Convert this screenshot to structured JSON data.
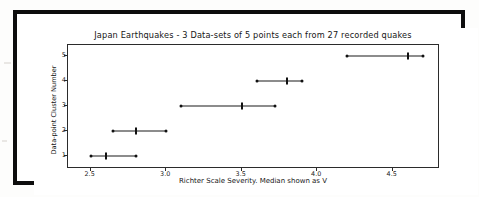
{
  "chart_data": {
    "type": "scatter",
    "title": "Japan Earthquakes - 3 Data-sets of 5 points each from 27 recorded quakes",
    "xlabel": "Richter Scale Severity. Median shown as V",
    "ylabel": "Data-point Cluster Number",
    "xlim": [
      2.35,
      4.8
    ],
    "ylim": [
      0.55,
      5.45
    ],
    "grid": false,
    "legend": null,
    "xticks": [
      2.5,
      3.0,
      3.5,
      4.0,
      4.5
    ],
    "xtick_labels": [
      "2.5",
      "3.0",
      "3.5",
      "4.0",
      "4.5"
    ],
    "yticks": [
      1,
      2,
      3,
      4,
      5
    ],
    "ytick_labels": [
      "1",
      "2",
      "3",
      "4",
      "5"
    ],
    "series": [
      {
        "name": "cluster-1",
        "cluster": 1,
        "min": 2.5,
        "median": 2.6,
        "max": 2.8,
        "points": [
          2.5,
          2.6,
          2.8
        ]
      },
      {
        "name": "cluster-2",
        "cluster": 2,
        "min": 2.65,
        "median": 2.8,
        "max": 3.0,
        "points": [
          2.65,
          2.8,
          3.0
        ]
      },
      {
        "name": "cluster-3",
        "cluster": 3,
        "min": 3.1,
        "median": 3.5,
        "max": 3.72,
        "points": [
          3.1,
          3.5,
          3.72
        ]
      },
      {
        "name": "cluster-4",
        "cluster": 4,
        "min": 3.6,
        "median": 3.8,
        "max": 3.9,
        "points": [
          3.6,
          3.8,
          3.9
        ]
      },
      {
        "name": "cluster-5",
        "cluster": 5,
        "min": 4.2,
        "median": 4.6,
        "max": 4.7,
        "points": [
          4.2,
          4.6,
          4.7
        ]
      }
    ],
    "colors": {
      "marker": "#111111",
      "line": "#1a1a1a",
      "axis": "#2b2b2b",
      "text": "#161616",
      "frame": "#0d0d0d",
      "background": "#ffffff"
    }
  }
}
